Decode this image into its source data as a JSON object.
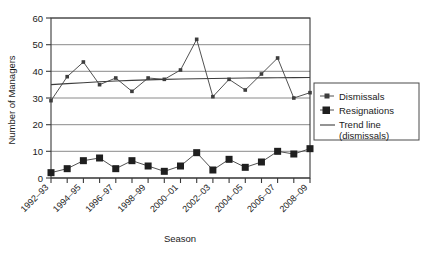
{
  "chart_data": {
    "type": "line",
    "title": "",
    "xlabel": "Season",
    "ylabel": "Number of Managers",
    "ylim": [
      0,
      60
    ],
    "yticks": [
      0,
      10,
      20,
      30,
      40,
      50,
      60
    ],
    "grid": true,
    "legend_position": "right",
    "categories": [
      "1992–93",
      "1993–94",
      "1994–95",
      "1995–96",
      "1996–97",
      "1997–98",
      "1998–99",
      "1999–2000",
      "2000–01",
      "2001–02",
      "2002–03",
      "2003–04",
      "2004–05",
      "2005–06",
      "2006–07",
      "2007–08",
      "2008–09"
    ],
    "xtick_labels_shown": [
      "1992–93",
      "1994–95",
      "1996–97",
      "1998–99",
      "2000–01",
      "2002–03",
      "2004–05",
      "2006–07",
      "2008–09"
    ],
    "series": [
      {
        "name": "Dismissals",
        "marker": "small-square",
        "values": [
          29,
          38,
          43.5,
          35,
          37.5,
          32.5,
          37.5,
          37,
          40.5,
          52,
          30.5,
          37,
          33,
          39,
          45,
          30,
          32
        ]
      },
      {
        "name": "Resignations",
        "marker": "large-square",
        "values": [
          2,
          3.5,
          6.5,
          7.5,
          3.5,
          6.5,
          4.5,
          2.5,
          4.5,
          9.5,
          3,
          7,
          4,
          6,
          10,
          9,
          11
        ]
      },
      {
        "name": "Trend line (dismissals)",
        "marker": "line",
        "values": [
          35,
          35.4,
          35.7,
          36.1,
          36.4,
          36.6,
          36.8,
          37,
          37.1,
          37.2,
          37.3,
          37.4,
          37.5,
          37.55,
          37.6,
          37.65,
          37.7
        ]
      }
    ]
  },
  "legend": {
    "entries": [
      {
        "label": "Dismissals"
      },
      {
        "label": "Resignations"
      },
      {
        "label": "Trend line"
      },
      {
        "label": "(dismissals)"
      }
    ]
  },
  "colors": {
    "series_line": "#3d3d3d",
    "gridline": "#8a8a8a",
    "axis": "#3a3a3a",
    "text": "#1a1a1a",
    "background": "#ffffff"
  }
}
